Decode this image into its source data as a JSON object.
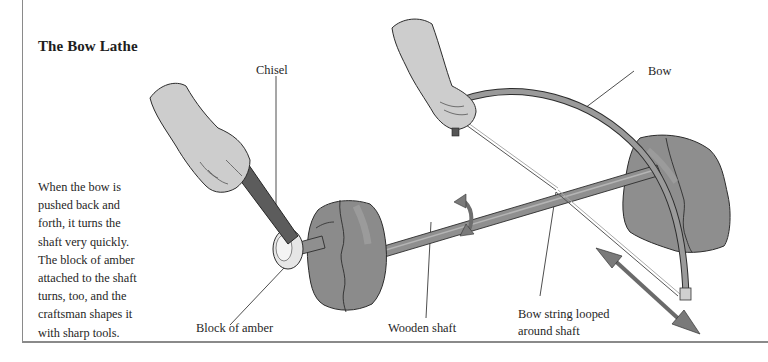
{
  "diagram": {
    "title": "The Bow Lathe",
    "description_lines": [
      "When the bow is",
      "pushed back and",
      "forth, it turns the",
      "shaft very quickly.",
      "The block of amber",
      "attached to the shaft",
      "turns, too, and the",
      "craftsman shapes it",
      "with sharp tools."
    ],
    "labels": {
      "chisel": "Chisel",
      "bow": "Bow",
      "block_of_amber": "Block of amber",
      "wooden_shaft": "Wooden shaft",
      "bow_string_line1": "Bow string looped",
      "bow_string_line2": "around shaft"
    },
    "colors": {
      "line": "#3a3a3a",
      "skin": "#cfcfcf",
      "stone": "#8c8c8c",
      "wood": "#8a8a8a",
      "chisel_handle": "#5c5c5c",
      "arrow": "#7a7a7a"
    }
  }
}
